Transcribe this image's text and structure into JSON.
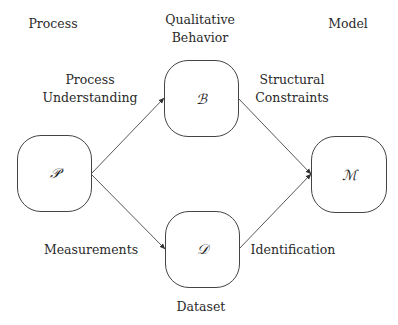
{
  "column_headers": {
    "left": "Process",
    "center": [
      "Qualitative",
      "Behavior"
    ],
    "right": "Model"
  },
  "nodes": {
    "process": {
      "symbol": "𝒫"
    },
    "behavior": {
      "symbol": "ℬ"
    },
    "dataset": {
      "symbol": "𝒟"
    },
    "model": {
      "symbol": "ℳ"
    }
  },
  "edge_labels": {
    "process_to_behavior": [
      "Process",
      "Understanding"
    ],
    "behavior_to_model": [
      "Structural",
      "Constraints"
    ],
    "process_to_dataset": "Measurements",
    "dataset_to_model": "Identification"
  },
  "bottom_label": "Dataset",
  "colors": {
    "stroke": "#444444",
    "background": "#ffffff",
    "text": "#2a2a2a"
  }
}
